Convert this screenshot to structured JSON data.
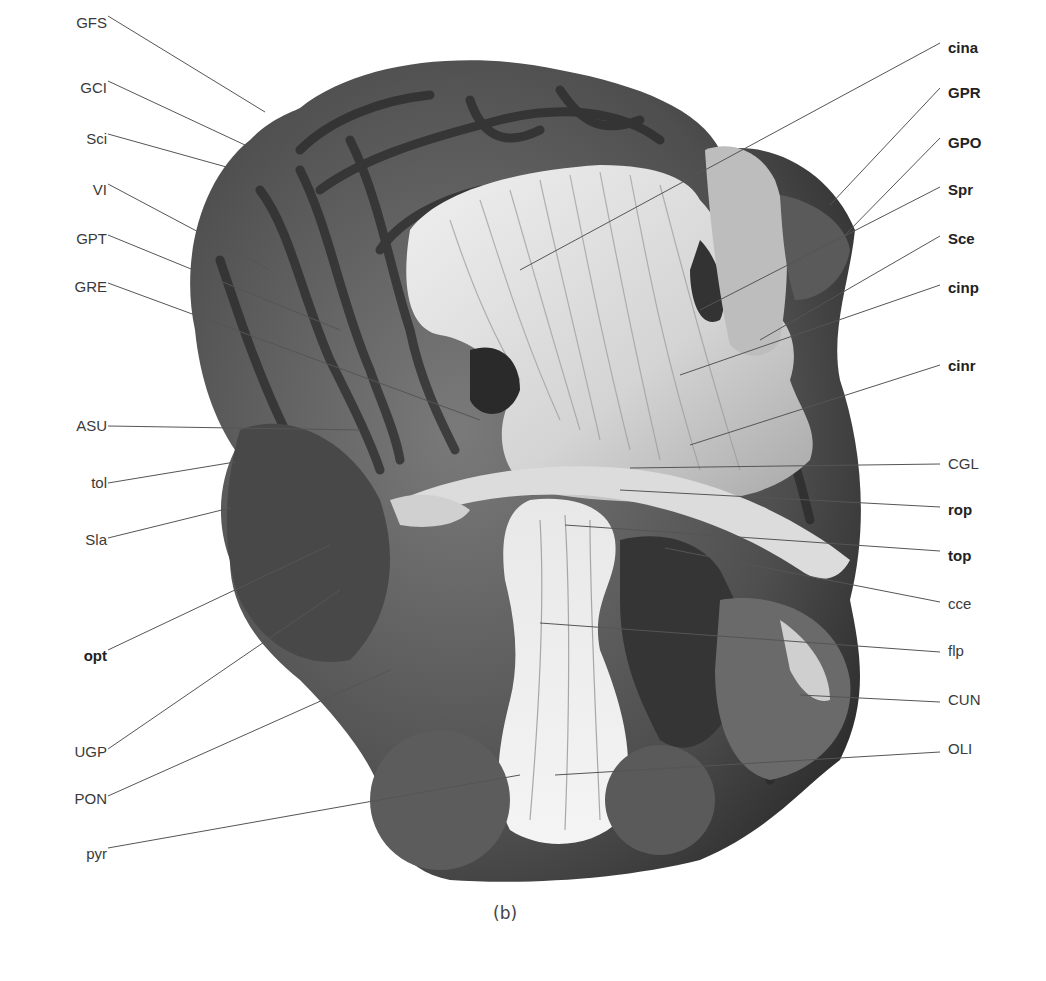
{
  "figure": {
    "caption": "(b)",
    "colors": {
      "background": "#ffffff",
      "leader_line": "#555555",
      "label_text": "#3a3a3a",
      "specimen_dark": "#3c3c3c",
      "specimen_mid": "#6e6e6e",
      "specimen_light": "#e2e2e2"
    }
  },
  "labels_left": [
    {
      "text": "GFS",
      "x": 37,
      "y": 14,
      "bold": false,
      "line": [
        108,
        16,
        265,
        112
      ]
    },
    {
      "text": "GCI",
      "x": 37,
      "y": 79,
      "bold": false,
      "line": [
        108,
        81,
        245,
        145
      ]
    },
    {
      "text": "Sci",
      "x": 37,
      "y": 130,
      "bold": false,
      "line": [
        108,
        134,
        230,
        168
      ]
    },
    {
      "text": "VI",
      "x": 37,
      "y": 181,
      "bold": false,
      "line": [
        108,
        184,
        270,
        270
      ]
    },
    {
      "text": "GPT",
      "x": 37,
      "y": 230,
      "bold": false,
      "line": [
        108,
        235,
        340,
        330
      ]
    },
    {
      "text": "GRE",
      "x": 37,
      "y": 278,
      "bold": false,
      "line": [
        108,
        283,
        480,
        420
      ]
    },
    {
      "text": "ASU",
      "x": 37,
      "y": 417,
      "bold": false,
      "line": [
        108,
        426,
        360,
        430
      ]
    },
    {
      "text": "tol",
      "x": 37,
      "y": 474,
      "bold": false,
      "line": [
        108,
        483,
        235,
        462
      ]
    },
    {
      "text": "Sla",
      "x": 37,
      "y": 531,
      "bold": false,
      "line": [
        108,
        538,
        230,
        508
      ]
    },
    {
      "text": "opt",
      "x": 37,
      "y": 647,
      "bold": true,
      "line": [
        108,
        650,
        330,
        545
      ]
    },
    {
      "text": "UGP",
      "x": 37,
      "y": 743,
      "bold": false,
      "line": [
        108,
        749,
        340,
        590
      ]
    },
    {
      "text": "PON",
      "x": 37,
      "y": 790,
      "bold": false,
      "line": [
        108,
        796,
        390,
        670
      ]
    },
    {
      "text": "pyr",
      "x": 37,
      "y": 845,
      "bold": false,
      "line": [
        108,
        848,
        520,
        775
      ]
    }
  ],
  "labels_right": [
    {
      "text": "cina",
      "x": 948,
      "y": 39,
      "bold": true,
      "line": [
        940,
        43,
        520,
        270
      ]
    },
    {
      "text": "GPR",
      "x": 948,
      "y": 84,
      "bold": true,
      "line": [
        940,
        88,
        830,
        205
      ]
    },
    {
      "text": "GPO",
      "x": 948,
      "y": 134,
      "bold": true,
      "line": [
        940,
        138,
        845,
        235
      ]
    },
    {
      "text": "Spr",
      "x": 948,
      "y": 181,
      "bold": true,
      "line": [
        940,
        187,
        700,
        310
      ]
    },
    {
      "text": "Sce",
      "x": 948,
      "y": 230,
      "bold": true,
      "line": [
        940,
        236,
        760,
        340
      ]
    },
    {
      "text": "cinp",
      "x": 948,
      "y": 279,
      "bold": true,
      "line": [
        940,
        285,
        680,
        375
      ]
    },
    {
      "text": "cinr",
      "x": 948,
      "y": 357,
      "bold": true,
      "line": [
        940,
        365,
        690,
        445
      ]
    },
    {
      "text": "CGL",
      "x": 948,
      "y": 455,
      "bold": false,
      "line": [
        940,
        464,
        630,
        468
      ]
    },
    {
      "text": "rop",
      "x": 948,
      "y": 501,
      "bold": true,
      "line": [
        940,
        507,
        620,
        490
      ]
    },
    {
      "text": "top",
      "x": 948,
      "y": 547,
      "bold": true,
      "line": [
        940,
        551,
        565,
        525
      ]
    },
    {
      "text": "cce",
      "x": 948,
      "y": 595,
      "bold": false,
      "line": [
        940,
        602,
        665,
        548
      ]
    },
    {
      "text": "flp",
      "x": 948,
      "y": 642,
      "bold": false,
      "line": [
        940,
        652,
        540,
        623
      ]
    },
    {
      "text": "CUN",
      "x": 948,
      "y": 691,
      "bold": false,
      "line": [
        940,
        702,
        800,
        695
      ]
    },
    {
      "text": "OLI",
      "x": 948,
      "y": 740,
      "bold": false,
      "line": [
        940,
        752,
        555,
        775
      ]
    }
  ]
}
